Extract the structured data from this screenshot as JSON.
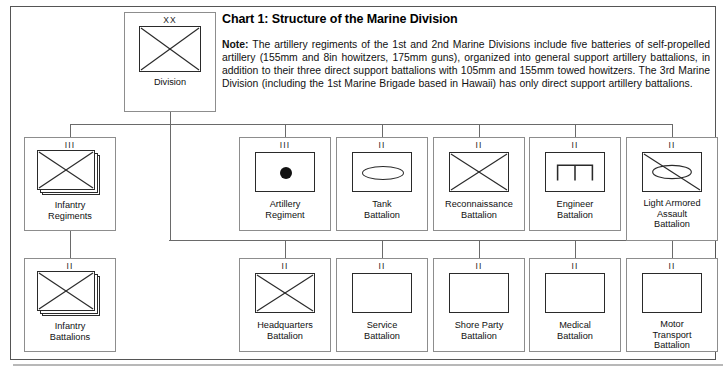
{
  "header": {
    "title": "Chart 1: Structure of the Marine Division",
    "note_label": "Note:",
    "note_text": " The artillery regiments of the 1st and 2nd Marine Divisions include five batteries of self-propelled artillery (155mm and 8in howitzers, 175mm guns), organized into general support artillery battalions, in addition to their three direct support battalions with 105mm and 155mm towed howitzers. The 3rd Marine Division (including the 1st Marine Brigade based in Hawaii) has only direct support artillery battalions."
  },
  "units": {
    "division": {
      "echelon": "XX",
      "label": "Division",
      "symbol": "cross-infantry"
    },
    "infantry_regiments": {
      "echelon": "III",
      "label": "Infantry\nRegiments",
      "symbol": "cross-infantry-stacked"
    },
    "infantry_battalions": {
      "echelon": "II",
      "label": "Infantry\nBattalions",
      "symbol": "cross-infantry-stacked"
    },
    "artillery_regiment": {
      "echelon": "III",
      "label": "Artillery\nRegiment",
      "symbol": "filled-dot-artillery"
    },
    "tank_battalion": {
      "echelon": "II",
      "label": "Tank\nBattalion",
      "symbol": "ellipse-armor"
    },
    "reconnaissance_battalion": {
      "echelon": "II",
      "label": "Reconnaissance\nBattalion",
      "symbol": "cross-infantry"
    },
    "engineer_battalion": {
      "echelon": "II",
      "label": "Engineer\nBattalion",
      "symbol": "engineer-bridge"
    },
    "light_armored_assault_battalion": {
      "echelon": "II",
      "label": "Light Armored\nAssault\nBattalion",
      "symbol": "ellipse-diagonal-light-armor"
    },
    "headquarters_battalion": {
      "echelon": "II",
      "label": "Headquarters\nBattalion",
      "symbol": "cross-infantry"
    },
    "service_battalion": {
      "echelon": "II",
      "label": "Service\nBattalion",
      "symbol": "plain-box"
    },
    "shore_party_battalion": {
      "echelon": "II",
      "label": "Shore Party\nBattalion",
      "symbol": "plain-box"
    },
    "medical_battalion": {
      "echelon": "II",
      "label": "Medical\nBattalion",
      "symbol": "plain-box"
    },
    "motor_transport_battalion": {
      "echelon": "II",
      "label": "Motor\nTransport\nBattalion",
      "symbol": "plain-box"
    }
  },
  "colors": {
    "frame": "#555555",
    "cell_border": "#8d8d8d",
    "symbol_stroke": "#2a2a2a",
    "connector": "#6a6a6a",
    "text": "#111111",
    "background": "#ffffff"
  },
  "chart_data": {
    "type": "diagram",
    "title": "Chart 1: Structure of the Marine Division",
    "layout": "organizational-tree",
    "root": "Division",
    "levels": [
      {
        "level": 0,
        "units": [
          "Division"
        ]
      },
      {
        "level": 1,
        "units": [
          "Infantry Regiments",
          "Artillery Regiment",
          "Tank Battalion",
          "Reconnaissance Battalion",
          "Engineer Battalion",
          "Light Armored Assault Battalion"
        ]
      },
      {
        "level": 2,
        "units": [
          "Infantry Battalions",
          "Headquarters Battalion",
          "Service Battalion",
          "Shore Party Battalion",
          "Medical Battalion",
          "Motor Transport Battalion"
        ]
      }
    ],
    "edges": [
      {
        "from": "Division",
        "to": "Infantry Regiments"
      },
      {
        "from": "Division",
        "to": "Artillery Regiment"
      },
      {
        "from": "Division",
        "to": "Tank Battalion"
      },
      {
        "from": "Division",
        "to": "Reconnaissance Battalion"
      },
      {
        "from": "Division",
        "to": "Engineer Battalion"
      },
      {
        "from": "Division",
        "to": "Light Armored Assault Battalion"
      },
      {
        "from": "Infantry Regiments",
        "to": "Infantry Battalions"
      },
      {
        "from": "Division",
        "to": "Headquarters Battalion"
      },
      {
        "from": "Division",
        "to": "Service Battalion"
      },
      {
        "from": "Division",
        "to": "Shore Party Battalion"
      },
      {
        "from": "Division",
        "to": "Medical Battalion"
      },
      {
        "from": "Division",
        "to": "Motor Transport Battalion"
      }
    ],
    "echelon_legend": {
      "XX": "Division",
      "III": "Regiment",
      "II": "Battalion"
    }
  }
}
